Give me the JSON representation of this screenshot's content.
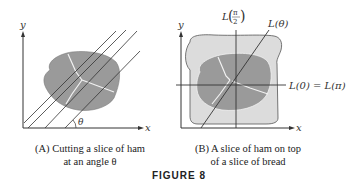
{
  "panel_a": {
    "axis_x": "x",
    "axis_y": "y",
    "angle_label": "θ",
    "caption_line1": "(A) Cutting a slice of ham",
    "caption_line2": "at an angle θ"
  },
  "panel_b": {
    "axis_x": "x",
    "axis_y": "y",
    "label_vertical": "L(π/2)",
    "label_vertical_prefix": "L",
    "label_vertical_num": "π",
    "label_vertical_den": "2",
    "label_diagonal": "L(θ)",
    "label_horizontal": "L(0) = L(π)",
    "caption_line1": "(B) A slice of ham on top",
    "caption_line2": "of a slice of bread"
  },
  "figure_label": "FIGURE 8",
  "colors": {
    "ham": "#9a9a9a",
    "bread": "#dcdcdc",
    "fat_lines": "#f2f2f2",
    "lines": "#333333"
  }
}
